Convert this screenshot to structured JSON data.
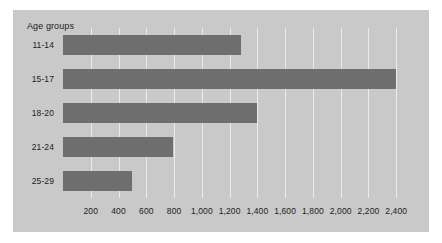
{
  "chart_data": {
    "type": "bar",
    "orientation": "horizontal",
    "title": "Age groups",
    "xlabel": "",
    "ylabel": "",
    "categories": [
      "11-14",
      "15-17",
      "18-20",
      "21-24",
      "25-29"
    ],
    "values": [
      1280,
      2400,
      1400,
      790,
      500
    ],
    "xlim": [
      0,
      2600
    ],
    "xticks": [
      200,
      400,
      600,
      800,
      1000,
      1200,
      1400,
      1600,
      1800,
      2000,
      2200,
      2400
    ],
    "xtick_labels": [
      "200",
      "400",
      "600",
      "800",
      "1,000",
      "1,200",
      "1,400",
      "1,600",
      "1,800",
      "2,000",
      "2,200",
      "2,400"
    ],
    "grid": true,
    "grid_axis": "x",
    "legend": false,
    "colors": {
      "bar": "#6e6e6e",
      "panel_background": "#c9c9c9",
      "figure_background": "#ffffff",
      "gridline": "#eceaea",
      "text": "#1c1c1c"
    }
  }
}
